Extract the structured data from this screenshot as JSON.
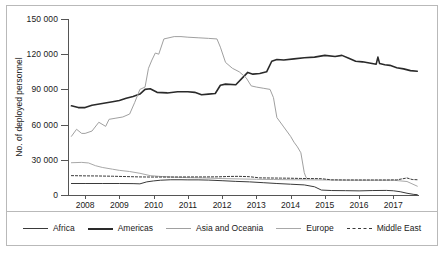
{
  "chart_data": {
    "type": "line",
    "title": "",
    "xlabel": "",
    "ylabel": "No. of deployed personnel",
    "xlim": [
      2007.5,
      2017.75
    ],
    "ylim": [
      0,
      150000
    ],
    "grid": false,
    "legend_position": "bottom",
    "y_ticks": [
      "0",
      "30 000",
      "60 000",
      "90 000",
      "120 000",
      "150 000"
    ],
    "y_tick_values": [
      0,
      30000,
      60000,
      90000,
      120000,
      150000
    ],
    "x_ticks": [
      "2008",
      "2009",
      "2010",
      "2011",
      "2012",
      "2013",
      "2014",
      "2015",
      "2016",
      "2017"
    ],
    "x_tick_values": [
      2008,
      2009,
      2010,
      2011,
      2012,
      2013,
      2014,
      2015,
      2016,
      2017
    ],
    "series": [
      {
        "name": "Africa",
        "color": "#3a3a3a",
        "width": 1.0,
        "dash": "none",
        "x": [
          2007.6,
          2008.0,
          2008.5,
          2009.0,
          2009.4,
          2009.6,
          2009.8,
          2010.0,
          2010.2,
          2010.5,
          2010.8,
          2011.0,
          2011.3,
          2011.6,
          2012.0,
          2012.4,
          2012.8,
          2013.2,
          2013.6,
          2014.0,
          2014.4,
          2014.7,
          2014.9,
          2015.2,
          2015.6,
          2016.0,
          2016.4,
          2016.8,
          2017.0,
          2017.2,
          2017.4,
          2017.6,
          2017.7
        ],
        "y": [
          9800,
          9800,
          9800,
          9800,
          9700,
          9500,
          11200,
          12000,
          12600,
          13000,
          13000,
          12900,
          12900,
          12700,
          12200,
          11600,
          11200,
          10500,
          9800,
          9200,
          8600,
          7000,
          4200,
          3800,
          3700,
          3500,
          3800,
          3900,
          3600,
          2800,
          1500,
          500,
          300
        ]
      },
      {
        "name": "Americas",
        "color": "#2a2a2a",
        "width": 1.6,
        "dash": "none",
        "x": [
          2007.6,
          2007.8,
          2008.0,
          2008.2,
          2008.5,
          2008.8,
          2009.0,
          2009.2,
          2009.4,
          2009.6,
          2009.75,
          2009.9,
          2010.1,
          2010.4,
          2010.7,
          2011.0,
          2011.2,
          2011.4,
          2011.6,
          2011.8,
          2011.95,
          2012.1,
          2012.4,
          2012.6,
          2012.75,
          2012.9,
          2013.1,
          2013.3,
          2013.45,
          2013.6,
          2013.8,
          2014.1,
          2014.4,
          2014.7,
          2015.0,
          2015.3,
          2015.5,
          2015.7,
          2015.9,
          2016.1,
          2016.3,
          2016.5,
          2016.55,
          2016.6,
          2016.75,
          2016.9,
          2017.1,
          2017.3,
          2017.5,
          2017.7
        ],
        "y": [
          76000,
          74500,
          74500,
          76500,
          78000,
          79500,
          80500,
          82500,
          84000,
          86000,
          90000,
          90500,
          87500,
          87000,
          88000,
          88000,
          87500,
          85500,
          86000,
          86500,
          93500,
          94500,
          94000,
          100000,
          104500,
          103000,
          103500,
          105000,
          114000,
          115500,
          115000,
          116000,
          117000,
          117500,
          119000,
          118000,
          119000,
          116500,
          114000,
          113500,
          112500,
          111500,
          117500,
          112000,
          111000,
          110500,
          108500,
          107500,
          106000,
          105500
        ]
      },
      {
        "name": "Asia and Oceania",
        "color": "#a0a0a0",
        "width": 1.0,
        "dash": "none",
        "x": [
          2007.6,
          2007.75,
          2007.9,
          2008.0,
          2008.2,
          2008.4,
          2008.6,
          2008.7,
          2008.9,
          2009.1,
          2009.3,
          2009.45,
          2009.6,
          2009.75,
          2009.85,
          2009.95,
          2010.05,
          2010.15,
          2010.3,
          2010.45,
          2010.6,
          2010.8,
          2011.0,
          2011.3,
          2011.6,
          2011.85,
          2011.95,
          2012.1,
          2012.3,
          2012.5,
          2012.7,
          2012.85,
          2013.0,
          2013.2,
          2013.4,
          2013.5,
          2013.6,
          2013.8,
          2014.0,
          2014.1,
          2014.2,
          2014.3,
          2014.4,
          2014.45,
          2014.5
        ],
        "y": [
          50000,
          56000,
          52500,
          52500,
          54500,
          62000,
          58500,
          64500,
          65500,
          66500,
          69000,
          79000,
          90000,
          92000,
          108000,
          115000,
          121000,
          120000,
          133000,
          134000,
          135000,
          135000,
          134500,
          134000,
          133500,
          133000,
          126000,
          113000,
          108000,
          105000,
          100000,
          93000,
          92000,
          91000,
          90000,
          83000,
          66000,
          58000,
          50000,
          45000,
          41000,
          36000,
          19000,
          15000,
          13800
        ]
      },
      {
        "name": "Europe",
        "color": "#a8a8a8",
        "width": 1.0,
        "dash": "none",
        "x": [
          2007.6,
          2007.9,
          2008.1,
          2008.3,
          2008.5,
          2008.8,
          2009.0,
          2009.3,
          2009.6,
          2009.9,
          2010.2,
          2010.6,
          2011.0,
          2011.5,
          2012.0,
          2012.5,
          2013.0,
          2013.5,
          2014.0,
          2014.5,
          2015.0,
          2015.5,
          2016.0,
          2016.5,
          2017.0,
          2017.4,
          2017.7
        ],
        "y": [
          27500,
          27800,
          27300,
          25000,
          23500,
          22000,
          21000,
          20000,
          18500,
          16500,
          15800,
          15200,
          14800,
          14500,
          14000,
          13700,
          13400,
          13200,
          13000,
          12900,
          12800,
          12700,
          12600,
          12600,
          12600,
          11500,
          7500
        ]
      },
      {
        "name": "Middle East",
        "color": "#3a3a3a",
        "width": 1.0,
        "dash": "2.2,1.8",
        "x": [
          2007.6,
          2008.0,
          2008.4,
          2008.8,
          2009.2,
          2009.6,
          2010.0,
          2010.5,
          2011.0,
          2011.5,
          2011.9,
          2012.2,
          2012.5,
          2012.8,
          2013.1,
          2013.4,
          2013.7,
          2014.0,
          2014.3,
          2014.6,
          2014.9,
          2015.2,
          2015.6,
          2016.0,
          2016.4,
          2016.8,
          2017.1,
          2017.4,
          2017.55,
          2017.7
        ],
        "y": [
          16500,
          16300,
          16200,
          16000,
          15700,
          15400,
          15300,
          15300,
          15400,
          15400,
          15500,
          15800,
          15900,
          15600,
          14600,
          14500,
          14400,
          14300,
          14100,
          14000,
          13900,
          12900,
          12800,
          12800,
          12800,
          12800,
          12900,
          14500,
          13200,
          13000
        ]
      }
    ]
  },
  "legend": {
    "items": [
      {
        "label": "Africa",
        "color": "#3a3a3a",
        "width": 1.6,
        "dash": "none"
      },
      {
        "label": "Americas",
        "color": "#2a2a2a",
        "width": 2.2,
        "dash": "none"
      },
      {
        "label": "Asia and Oceania",
        "color": "#a0a0a0",
        "width": 1.3,
        "dash": "none"
      },
      {
        "label": "Europe",
        "color": "#a8a8a8",
        "width": 1.3,
        "dash": "none"
      },
      {
        "label": "Middle East",
        "color": "#3a3a3a",
        "width": 1.3,
        "dash": "3,2"
      }
    ]
  }
}
